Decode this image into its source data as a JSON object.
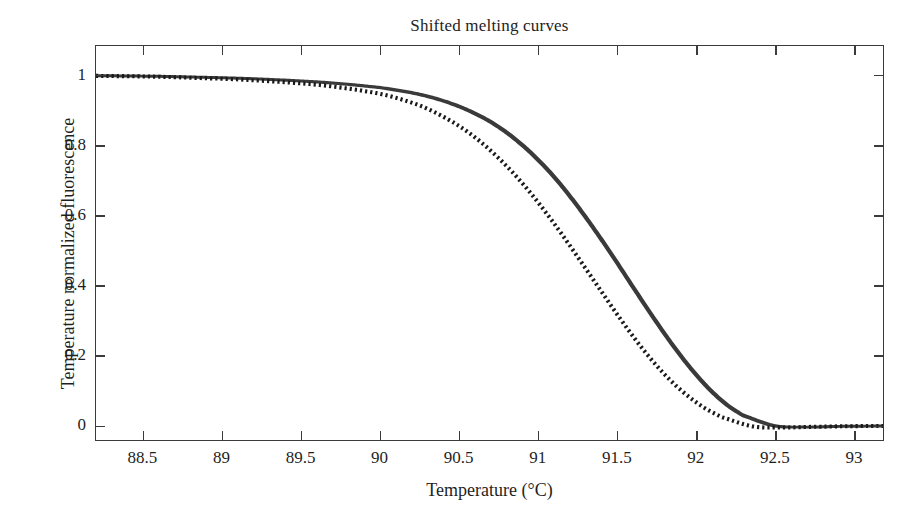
{
  "chart_data": {
    "type": "line",
    "title": "Shifted melting curves",
    "xlabel": "Temperature (°C)",
    "ylabel": "Temperature normalized fluorescence",
    "xlim": [
      88.2,
      93.19
    ],
    "ylim": [
      -0.045,
      1.085
    ],
    "grid": false,
    "legend": "none",
    "xticks": [
      88.5,
      89,
      89.5,
      90,
      90.5,
      91,
      91.5,
      92,
      92.5,
      93
    ],
    "xticklabels": [
      "88.5",
      "89",
      "89.5",
      "90",
      "90.5",
      "91",
      "91.5",
      "92",
      "92.5",
      "93"
    ],
    "yticks": [
      0,
      0.2,
      0.4,
      0.6,
      0.8,
      1
    ],
    "yticklabels": [
      "0",
      "0.2",
      "0.4",
      "0.6",
      "0.8",
      "1"
    ],
    "line_color": "#3a3a3a",
    "dotted_color": "#1a1a1a",
    "x": [
      88.2,
      88.4,
      88.6,
      88.8,
      89.0,
      89.2,
      89.4,
      89.6,
      89.8,
      90.0,
      90.1,
      90.2,
      90.3,
      90.4,
      90.5,
      90.6,
      90.7,
      90.8,
      90.9,
      91.0,
      91.1,
      91.2,
      91.3,
      91.4,
      91.5,
      91.6,
      91.7,
      91.8,
      91.9,
      92.0,
      92.1,
      92.2,
      92.3,
      92.5,
      92.7,
      92.9,
      93.19
    ],
    "series": [
      {
        "name": "melting curves bundle (solid, many overlapping traces)",
        "style": "solid",
        "width_units": 0.028,
        "values": [
          1.0,
          0.999,
          0.998,
          0.996,
          0.994,
          0.991,
          0.987,
          0.982,
          0.975,
          0.966,
          0.959,
          0.951,
          0.941,
          0.928,
          0.912,
          0.892,
          0.868,
          0.838,
          0.802,
          0.76,
          0.712,
          0.657,
          0.597,
          0.533,
          0.466,
          0.397,
          0.329,
          0.263,
          0.201,
          0.145,
          0.096,
          0.056,
          0.026,
          -0.004,
          -0.008,
          -0.006,
          -0.005
        ]
      },
      {
        "name": "shifted melting curve (dotted)",
        "style": "dotted",
        "shift_degC": -0.135,
        "width_units": 0.012,
        "values": [
          1.0,
          0.999,
          0.998,
          0.996,
          0.993,
          0.99,
          0.985,
          0.979,
          0.971,
          0.959,
          0.951,
          0.941,
          0.928,
          0.912,
          0.891,
          0.866,
          0.836,
          0.8,
          0.758,
          0.711,
          0.658,
          0.6,
          0.538,
          0.473,
          0.407,
          0.341,
          0.277,
          0.217,
          0.163,
          0.116,
          0.077,
          0.045,
          0.021,
          -0.006,
          -0.009,
          -0.007,
          -0.005
        ]
      }
    ]
  }
}
